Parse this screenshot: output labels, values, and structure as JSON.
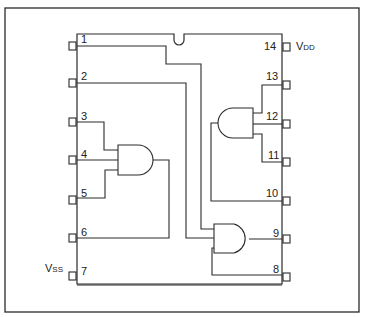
{
  "diagram": {
    "type": "IC pinout / logic diagram (quad 2-input AND gate, 14-pin DIP)",
    "colors": {
      "line": "#2a2a2a",
      "background": "#ffffff"
    },
    "supply_labels": {
      "vdd": {
        "main": "V",
        "sub": "DD",
        "pin": 14
      },
      "vss": {
        "main": "V",
        "sub": "SS",
        "pin": 7
      }
    },
    "left_pins": [
      {
        "number": "1"
      },
      {
        "number": "2"
      },
      {
        "number": "3"
      },
      {
        "number": "4"
      },
      {
        "number": "5"
      },
      {
        "number": "6"
      },
      {
        "number": "7"
      }
    ],
    "right_pins": [
      {
        "number": "14"
      },
      {
        "number": "13"
      },
      {
        "number": "12"
      },
      {
        "number": "11"
      },
      {
        "number": "10"
      },
      {
        "number": "9"
      },
      {
        "number": "8"
      }
    ],
    "gates": [
      {
        "name": "gate-a",
        "inputs": [
          "3",
          "5"
        ],
        "output": "4",
        "note": "inputs via pins 3 and 5, output to pin 4"
      },
      {
        "name": "gate-b",
        "inputs": [
          "13",
          "11"
        ],
        "output": "12"
      },
      {
        "name": "gate-c",
        "inputs": [
          "1",
          "2"
        ],
        "output": "9"
      },
      {
        "name": "gate-d",
        "inputs": [
          "6",
          "10",
          "8"
        ],
        "output": "9"
      }
    ]
  }
}
